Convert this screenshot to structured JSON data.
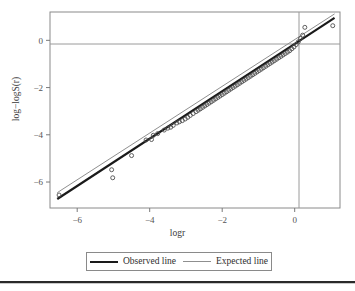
{
  "chart_data": {
    "type": "scatter",
    "title": "",
    "xlabel": "logr",
    "ylabel": "log−logS(r)",
    "xlim": [
      -6.75,
      1.25
    ],
    "ylim": [
      -7.1,
      1.2
    ],
    "xticks": [
      -6,
      -4,
      -2,
      0
    ],
    "xticklabels": [
      "−6",
      "−4",
      "−2",
      "0"
    ],
    "yticks": [
      0,
      -2,
      -4,
      -6
    ],
    "yticklabels": [
      "0",
      "−2",
      "−4",
      "−6"
    ],
    "grid": false,
    "reference_lines": {
      "horizontal_y": 0,
      "vertical_x": 0,
      "color": "#9a9a9a"
    },
    "legend": {
      "position": "below-axes",
      "entries": [
        {
          "label": "Observed line",
          "style": "thick-solid",
          "color": "#1a1a1a",
          "width": 2.2
        },
        {
          "label": "Expected line",
          "style": "thin-solid",
          "color": "#8f8f8f",
          "width": 1.0
        }
      ]
    },
    "series": [
      {
        "name": "Observed line",
        "type": "line",
        "color": "#1a1a1a",
        "width": 2.2,
        "points": [
          [
            -6.55,
            -6.72
          ],
          [
            1.1,
            0.95
          ]
        ]
      },
      {
        "name": "Expected line",
        "type": "line",
        "color": "#8f8f8f",
        "width": 1.0,
        "points": [
          [
            -6.55,
            -6.45
          ],
          [
            1.1,
            1.12
          ]
        ]
      },
      {
        "name": "Observed points",
        "type": "scatter",
        "marker": "open-circle",
        "color": "#4d4d4d",
        "radius": 2.0,
        "x": [
          -6.5,
          -5.05,
          -5.02,
          -4.5,
          -4.1,
          -3.95,
          -3.9,
          -3.78,
          -3.6,
          -3.5,
          -3.42,
          -3.35,
          -3.25,
          -3.18,
          -3.1,
          -3.02,
          -2.95,
          -2.88,
          -2.8,
          -2.72,
          -2.66,
          -2.6,
          -2.54,
          -2.48,
          -2.42,
          -2.36,
          -2.3,
          -2.24,
          -2.18,
          -2.12,
          -2.06,
          -2.0,
          -1.94,
          -1.88,
          -1.82,
          -1.76,
          -1.7,
          -1.64,
          -1.58,
          -1.52,
          -1.46,
          -1.4,
          -1.34,
          -1.28,
          -1.22,
          -1.16,
          -1.1,
          -1.04,
          -0.98,
          -0.92,
          -0.86,
          -0.8,
          -0.74,
          -0.68,
          -0.62,
          -0.56,
          -0.5,
          -0.44,
          -0.38,
          -0.32,
          -0.26,
          -0.2,
          -0.14,
          -0.08,
          -0.02,
          0.04,
          0.1,
          0.16,
          0.22,
          0.28,
          1.05
        ],
        "y": [
          -6.55,
          -5.48,
          -5.82,
          -4.88,
          -4.22,
          -4.2,
          -4.02,
          -3.95,
          -3.8,
          -3.72,
          -3.68,
          -3.6,
          -3.5,
          -3.45,
          -3.4,
          -3.33,
          -3.26,
          -3.18,
          -3.1,
          -3.02,
          -2.96,
          -2.9,
          -2.84,
          -2.78,
          -2.72,
          -2.66,
          -2.6,
          -2.54,
          -2.48,
          -2.42,
          -2.36,
          -2.3,
          -2.24,
          -2.18,
          -2.12,
          -2.06,
          -2.0,
          -1.94,
          -1.88,
          -1.82,
          -1.76,
          -1.7,
          -1.64,
          -1.58,
          -1.52,
          -1.46,
          -1.4,
          -1.34,
          -1.28,
          -1.22,
          -1.16,
          -1.1,
          -1.04,
          -0.98,
          -0.92,
          -0.86,
          -0.8,
          -0.74,
          -0.68,
          -0.62,
          -0.56,
          -0.5,
          -0.44,
          -0.36,
          -0.28,
          -0.18,
          -0.06,
          0.08,
          0.22,
          0.55,
          0.62
        ]
      }
    ]
  },
  "axes": {
    "x_title": "logr",
    "y_title": "log−logS(r)"
  },
  "legend": {
    "observed_label": "Observed line",
    "expected_label": "Expected line"
  }
}
